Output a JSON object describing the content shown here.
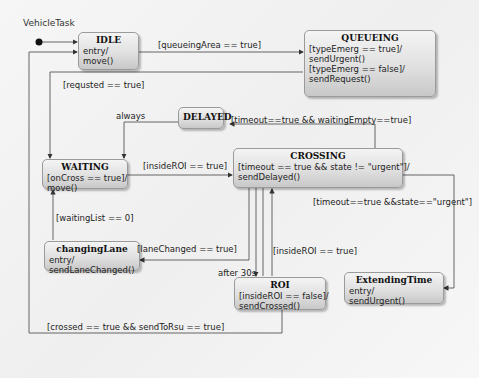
{
  "diagram": {
    "title": "VehicleTask",
    "states": {
      "idle": {
        "name": "IDLE",
        "body": "entry/\nmove()"
      },
      "queueing": {
        "name": "QUEUEING",
        "body": "[typeEmerg == true]/\nsendUrgent()\n[typeEmerg == false]/\nsendRequest()"
      },
      "delayed": {
        "name": "DELAYED",
        "body": ""
      },
      "waiting": {
        "name": "WAITING",
        "body": "[onCross == true]/\nmove()"
      },
      "crossing": {
        "name": "CROSSING",
        "body": "[timeout == true && state != \"urgent\"]/\nsendDelayed()"
      },
      "changingLane": {
        "name": "changingLane",
        "body": "entry/\nsendLaneChanged()"
      },
      "roi": {
        "name": "ROI",
        "body": "[insideROI == false]/\nsendCrossed()"
      },
      "extendingTime": {
        "name": "ExtendingTime",
        "body": "entry/\nsendUrgent()"
      }
    },
    "transitions": {
      "idle_to_queueing": "[queueingArea == true]",
      "queueing_to_waiting": "[requsted == true]",
      "delayed_to_waiting": "always",
      "crossing_to_delayed": "[timeout==true && waitingEmpty==true]",
      "waiting_to_crossing": "[insideROI == true]",
      "crossing_to_extending": "[timeout==true &&state==\"urgent\"]",
      "changing_to_waiting": "[waitingList == 0]",
      "crossing_to_changing": "[laneChanged == true]",
      "roi_to_crossing": "[insideROI == true]",
      "crossing_to_roi": "after 30s",
      "roi_to_idle": "[crossed == true && sendToRsu == true]"
    },
    "caption": ""
  }
}
